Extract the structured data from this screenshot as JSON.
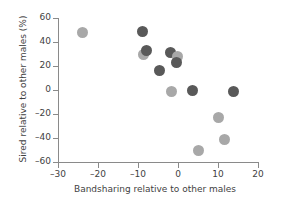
{
  "chart_data": {
    "type": "scatter",
    "title": "",
    "xlabel": "Bandsharing relative to other males",
    "ylabel": "Sired relative to other males (%)",
    "xlim": [
      -30,
      20
    ],
    "ylim": [
      -60,
      60
    ],
    "xticks": [
      -30,
      -20,
      -10,
      0,
      10,
      20
    ],
    "yticks": [
      -60,
      -40,
      -20,
      0,
      20,
      40,
      60
    ],
    "xtick_labels": [
      "–30",
      "–20",
      "–10",
      "0",
      "10",
      "20"
    ],
    "ytick_labels": [
      "–60",
      "–40",
      "–20",
      "0",
      "20",
      "40",
      "60"
    ],
    "grid": false,
    "legend": "none",
    "marker_colors": {
      "dark": "#595959",
      "light": "#a8a8a8"
    },
    "points": [
      {
        "x": -23.8,
        "y": 48,
        "color": "light"
      },
      {
        "x": -9.0,
        "y": 49,
        "color": "dark"
      },
      {
        "x": -8.6,
        "y": 30,
        "color": "light"
      },
      {
        "x": -7.8,
        "y": 33,
        "color": "dark"
      },
      {
        "x": -4.6,
        "y": 16,
        "color": "dark"
      },
      {
        "x": -1.8,
        "y": 31,
        "color": "dark"
      },
      {
        "x": -0.2,
        "y": 28,
        "color": "light"
      },
      {
        "x": -0.4,
        "y": 23,
        "color": "dark"
      },
      {
        "x": -1.6,
        "y": -1,
        "color": "light"
      },
      {
        "x": 3.6,
        "y": 0,
        "color": "dark"
      },
      {
        "x": 13.9,
        "y": -1,
        "color": "dark"
      },
      {
        "x": 10.1,
        "y": -23,
        "color": "light"
      },
      {
        "x": 11.6,
        "y": -41,
        "color": "light"
      },
      {
        "x": 5.0,
        "y": -50,
        "color": "light"
      }
    ]
  }
}
